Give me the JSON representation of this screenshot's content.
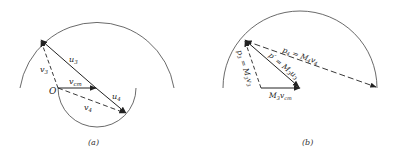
{
  "panels": [
    {
      "id": "a",
      "caption": "(a)",
      "labels": {
        "u3": "u",
        "u3_sub": "3",
        "v3": "v",
        "v3_sub": "3",
        "vcm": "v",
        "vcm_sub": "cm",
        "u4": "u",
        "u4_sub": "4",
        "v4": "v",
        "v4_sub": "4",
        "origin": "O"
      }
    },
    {
      "id": "b",
      "caption": "(b)",
      "labels": {
        "p4": "p",
        "p4_sub": "4",
        "p4_eq": " = M",
        "p4_eq_sub": "4",
        "p4_v": "v",
        "p4_v_sub": "4",
        "p3": "p",
        "p3_sub": "3",
        "p3_eq": " = M",
        "p3_eq_sub": "3",
        "p3_v": "v",
        "p3_v_sub": "3",
        "pprime": "p′ = M",
        "pprime_sub": "3",
        "pprime_u": "u",
        "pprime_u_sub": "3",
        "m3vcm": "M",
        "m3vcm_sub": "3",
        "m3vcm_v": "v",
        "m3vcm_v_sub": "cm"
      }
    }
  ],
  "colors": {
    "line": "#222222",
    "arc": "#444444",
    "background": "#ffffff"
  }
}
